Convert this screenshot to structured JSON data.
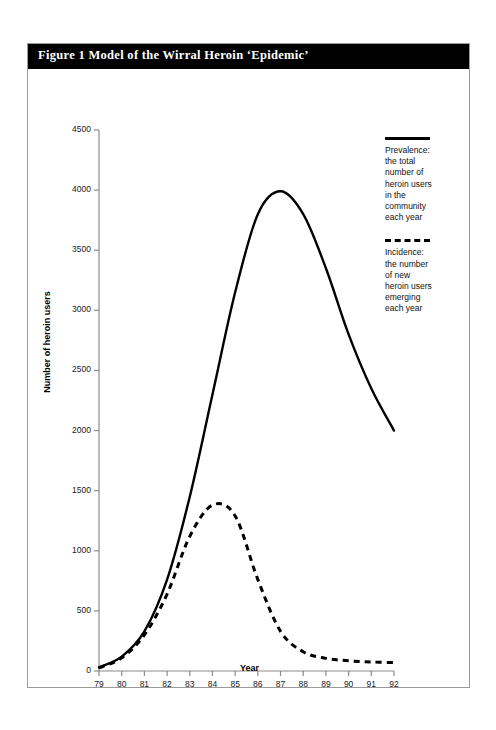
{
  "figure": {
    "caption_prefix": "Figure 1",
    "caption_text": "Model of the Wirral Heroin ‘Epidemic’",
    "caption_full": "Figure 1   Model of the Wirral Heroin ‘Epidemic’"
  },
  "legend": {
    "position": "top-right",
    "entries": [
      {
        "style": "solid",
        "name": "Prevalence",
        "label": "Prevalence:\nthe total\nnumber of\nheroin users\nin the\ncommunity\neach year"
      },
      {
        "style": "dashed",
        "name": "Incidence",
        "label": "Incidence:\nthe number\nof new\nheroin users\nemerging\neach year"
      }
    ]
  },
  "colors": {
    "line": "#000000",
    "axis": "#8c8c8c",
    "title_bar_bg": "#000000",
    "title_bar_fg": "#ffffff",
    "frame_border": "#9a9a9a",
    "background": "#ffffff"
  },
  "chart_data": {
    "type": "line",
    "title": "Model of the Wirral Heroin ‘Epidemic’",
    "xlabel": "Year",
    "ylabel": "Number of heroin users",
    "xlim": [
      79,
      92
    ],
    "ylim": [
      0,
      4500
    ],
    "grid": false,
    "legend_position": "top-right",
    "x_ticks": [
      79,
      80,
      81,
      82,
      83,
      84,
      85,
      86,
      87,
      88,
      89,
      90,
      91,
      92
    ],
    "x_tick_labels": [
      "79",
      "80",
      "81",
      "82",
      "83",
      "84",
      "85",
      "86",
      "87",
      "88",
      "89",
      "90",
      "91",
      "92"
    ],
    "y_ticks": [
      0,
      500,
      1000,
      1500,
      2000,
      2500,
      3000,
      3500,
      4000,
      4500
    ],
    "y_tick_labels": [
      "0",
      "500",
      "1000",
      "1500",
      "2000",
      "2500",
      "3000",
      "3500",
      "4000",
      "4500"
    ],
    "x": [
      79,
      80,
      81,
      82,
      83,
      84,
      85,
      86,
      87,
      88,
      89,
      90,
      91,
      92
    ],
    "series": [
      {
        "name": "Prevalence",
        "style": "solid",
        "values": [
          30,
          120,
          330,
          760,
          1450,
          2300,
          3150,
          3800,
          3990,
          3800,
          3350,
          2800,
          2350,
          2000
        ]
      },
      {
        "name": "Incidence",
        "style": "dashed",
        "values": [
          25,
          110,
          300,
          640,
          1120,
          1380,
          1290,
          760,
          330,
          160,
          105,
          85,
          75,
          70
        ]
      }
    ]
  }
}
